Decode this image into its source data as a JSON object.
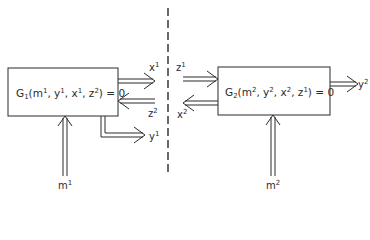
{
  "diagram": {
    "left_block": {
      "name": "G",
      "index": "1",
      "args": [
        {
          "base": "m",
          "sup": "1"
        },
        {
          "base": "y",
          "sup": "1"
        },
        {
          "base": "x",
          "sup": "1"
        },
        {
          "base": "z",
          "sup": "2"
        }
      ],
      "rhs": "= 0"
    },
    "right_block": {
      "name": "G",
      "index": "2",
      "args": [
        {
          "base": "m",
          "sup": "2"
        },
        {
          "base": "y",
          "sup": "2"
        },
        {
          "base": "x",
          "sup": "2"
        },
        {
          "base": "z",
          "sup": "1"
        }
      ],
      "rhs": "= 0"
    },
    "labels": {
      "x1": {
        "base": "x",
        "sup": "1"
      },
      "z2": {
        "base": "z",
        "sup": "2"
      },
      "y1": {
        "base": "y",
        "sup": "1"
      },
      "m1": {
        "base": "m",
        "sup": "1"
      },
      "z1": {
        "base": "z",
        "sup": "1"
      },
      "x2": {
        "base": "x",
        "sup": "2"
      },
      "y2": {
        "base": "y",
        "sup": "2"
      },
      "m2": {
        "base": "m",
        "sup": "2"
      }
    },
    "colors": {
      "stroke": "#2a2a2a",
      "background": "#ffffff"
    }
  }
}
